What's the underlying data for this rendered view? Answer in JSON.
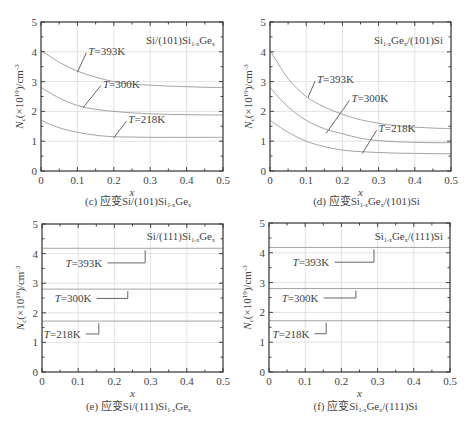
{
  "chart_data": [
    {
      "id": "c",
      "type": "line",
      "caption": "(c) 应变Si/(101)Si1-xGe x",
      "caption_parts": {
        "prefix": "(c) 应变Si/(101)Si",
        "sub1": "1-x",
        "mid": "Ge",
        "sub2": "x",
        "suffix": ""
      },
      "inset_label": {
        "a": "Si/(101)Si",
        "sub1": "1-x",
        "b": "Ge",
        "sub2": "x",
        "c": ""
      },
      "xlabel": "x",
      "ylabel": "Nc(×10^19)/cm^-3",
      "xlim": [
        0,
        0.5
      ],
      "ylim": [
        0,
        5
      ],
      "xticks": [
        "0",
        "0.1",
        "0.2",
        "0.3",
        "0.4",
        "0.5"
      ],
      "yticks": [
        "0",
        "1",
        "2",
        "3",
        "4",
        "5"
      ],
      "grid": true,
      "x": [
        0,
        0.05,
        0.1,
        0.15,
        0.2,
        0.25,
        0.3,
        0.35,
        0.4,
        0.45,
        0.5
      ],
      "series": [
        {
          "name": "T=393K",
          "values": [
            4.05,
            3.65,
            3.35,
            3.15,
            3.0,
            2.92,
            2.88,
            2.85,
            2.83,
            2.81,
            2.8
          ]
        },
        {
          "name": "T=300K",
          "values": [
            2.8,
            2.45,
            2.2,
            2.07,
            2.0,
            1.95,
            1.92,
            1.9,
            1.89,
            1.88,
            1.88
          ]
        },
        {
          "name": "T=218K",
          "values": [
            1.7,
            1.45,
            1.3,
            1.2,
            1.15,
            1.14,
            1.13,
            1.13,
            1.13,
            1.13,
            1.13
          ]
        }
      ]
    },
    {
      "id": "d",
      "type": "line",
      "caption_parts": {
        "prefix": "(d) 应变Si",
        "sub1": "1-x",
        "mid": "Ge",
        "sub2": "x",
        "suffix": "/(101)Si"
      },
      "inset_label": {
        "a": "Si",
        "sub1": "1-x",
        "b": "Ge",
        "sub2": "x",
        "c": "/(101)Si"
      },
      "xlabel": "x",
      "ylabel": "Nc(×10^19)/cm^-3",
      "xlim": [
        0,
        0.5
      ],
      "ylim": [
        0,
        5
      ],
      "xticks": [
        "0",
        "0.1",
        "0.2",
        "0.3",
        "0.4",
        "0.5"
      ],
      "yticks": [
        "0",
        "1",
        "2",
        "3",
        "4",
        "5"
      ],
      "grid": true,
      "x": [
        0,
        0.05,
        0.1,
        0.15,
        0.2,
        0.25,
        0.3,
        0.35,
        0.4,
        0.45,
        0.5
      ],
      "series": [
        {
          "name": "T=393K",
          "values": [
            4.05,
            3.1,
            2.5,
            2.15,
            1.9,
            1.72,
            1.6,
            1.52,
            1.47,
            1.44,
            1.42
          ]
        },
        {
          "name": "T=300K",
          "values": [
            2.8,
            2.15,
            1.7,
            1.42,
            1.25,
            1.1,
            1.02,
            0.98,
            0.96,
            0.95,
            0.95
          ]
        },
        {
          "name": "T=218K",
          "values": [
            1.7,
            1.3,
            1.0,
            0.82,
            0.7,
            0.65,
            0.62,
            0.6,
            0.59,
            0.58,
            0.58
          ]
        }
      ]
    },
    {
      "id": "e",
      "type": "line",
      "caption_parts": {
        "prefix": "(e) 应变Si/(111)Si",
        "sub1": "1-x",
        "mid": "Ge",
        "sub2": "x",
        "suffix": ""
      },
      "inset_label": {
        "a": "Si/(111)Si",
        "sub1": "1-x",
        "b": "Ge",
        "sub2": "x",
        "c": ""
      },
      "xlabel": "x",
      "ylabel": "Nc(×10^19)/cm^-3",
      "xlim": [
        0,
        0.5
      ],
      "ylim": [
        0,
        5
      ],
      "xticks": [
        "0",
        "0.1",
        "0.2",
        "0.3",
        "0.4",
        "0.5"
      ],
      "yticks": [
        "0",
        "1",
        "2",
        "3",
        "4",
        "5"
      ],
      "grid": true,
      "x": [
        0,
        0.5
      ],
      "series": [
        {
          "name": "T=393K",
          "values": [
            4.18,
            4.18
          ]
        },
        {
          "name": "T=300K",
          "values": [
            2.8,
            2.8
          ]
        },
        {
          "name": "T=218K",
          "values": [
            1.72,
            1.72
          ]
        }
      ]
    },
    {
      "id": "f",
      "type": "line",
      "caption_parts": {
        "prefix": "(f) 应变Si",
        "sub1": "1-x",
        "mid": "Ge",
        "sub2": "x",
        "suffix": "/(111)Si"
      },
      "inset_label": {
        "a": "Si",
        "sub1": "1-x",
        "b": "Ge",
        "sub2": "x",
        "c": "/(111)Si"
      },
      "xlabel": "x",
      "ylabel": "Nc(×10^19)/cm^-3",
      "xlim": [
        0,
        0.5
      ],
      "ylim": [
        0,
        5
      ],
      "xticks": [
        "0",
        "0.1",
        "0.2",
        "0.3",
        "0.4",
        "0.5"
      ],
      "yticks": [
        "0",
        "1",
        "2",
        "3",
        "4",
        "5"
      ],
      "grid": true,
      "x": [
        0,
        0.5
      ],
      "series": [
        {
          "name": "T=393K",
          "values": [
            4.18,
            4.18
          ]
        },
        {
          "name": "T=300K",
          "values": [
            2.8,
            2.8
          ]
        },
        {
          "name": "T=218K",
          "values": [
            1.72,
            1.72
          ]
        }
      ]
    }
  ],
  "layout": {
    "panels": [
      {
        "x0": 41,
        "y0": 22,
        "x1": 223,
        "y1": 171,
        "caption_y": 205,
        "inset_x": 215,
        "inset_y": 44,
        "annots": [
          {
            "text": "T=393K",
            "lx": 0.13,
            "ly": 3.9,
            "px": 0.1,
            "py": 3.35
          },
          {
            "text": "T=300K",
            "lx": 0.17,
            "ly": 2.8,
            "px": 0.115,
            "py": 2.15
          },
          {
            "text": "T=218K",
            "lx": 0.24,
            "ly": 1.6,
            "px": 0.2,
            "py": 1.15
          }
        ],
        "style": "diag"
      },
      {
        "x0": 270,
        "y0": 22,
        "x1": 451,
        "y1": 171,
        "caption_y": 205,
        "inset_x": 443,
        "inset_y": 44,
        "annots": [
          {
            "text": "T=393K",
            "lx": 0.13,
            "ly": 2.95,
            "px": 0.105,
            "py": 2.5
          },
          {
            "text": "T=300K",
            "lx": 0.225,
            "ly": 2.3,
            "px": 0.155,
            "py": 1.3
          },
          {
            "text": "T=218K",
            "lx": 0.3,
            "ly": 1.3,
            "px": 0.255,
            "py": 0.62
          }
        ],
        "style": "diag"
      },
      {
        "x0": 42,
        "y0": 224,
        "x1": 223,
        "y1": 372,
        "caption_y": 410,
        "inset_x": 215,
        "inset_y": 240,
        "annots": [
          {
            "text": "T=393K",
            "lx": 0.065,
            "ly": 3.55,
            "px": 0.285,
            "py": 4.18,
            "hx": 0.285
          },
          {
            "text": "T=300K",
            "lx": 0.035,
            "ly": 2.35,
            "px": 0.237,
            "py": 2.8,
            "hx": 0.237
          },
          {
            "text": "T=218K",
            "lx": 0.005,
            "ly": 1.15,
            "px": 0.157,
            "py": 1.72,
            "hx": 0.157
          }
        ],
        "style": "step"
      },
      {
        "x0": 269,
        "y0": 223,
        "x1": 450,
        "y1": 372,
        "caption_y": 410,
        "inset_x": 443,
        "inset_y": 240,
        "annots": [
          {
            "text": "T=393K",
            "lx": 0.065,
            "ly": 3.55,
            "px": 0.29,
            "py": 4.18,
            "hx": 0.29
          },
          {
            "text": "T=300K",
            "lx": 0.035,
            "ly": 2.35,
            "px": 0.24,
            "py": 2.8,
            "hx": 0.24
          },
          {
            "text": "T=218K",
            "lx": 0.01,
            "ly": 1.15,
            "px": 0.158,
            "py": 1.72,
            "hx": 0.158
          }
        ],
        "style": "step"
      }
    ]
  }
}
